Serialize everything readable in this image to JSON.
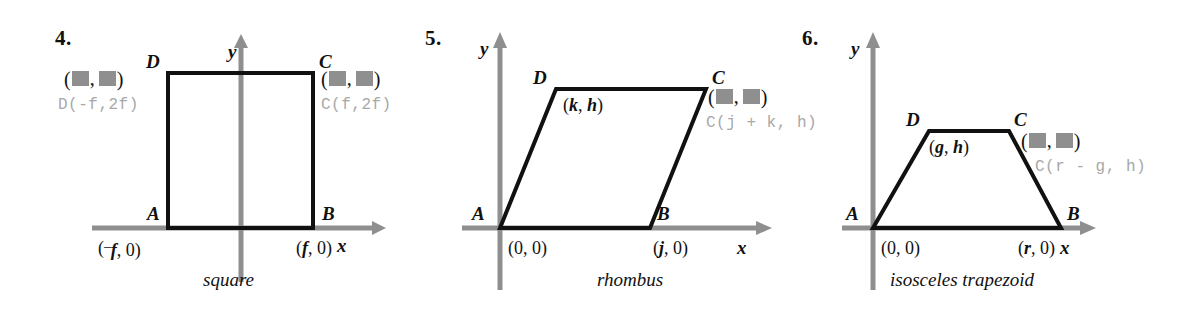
{
  "page": {
    "background": "#ffffff",
    "axis_color": "#8f8f8f",
    "shape_color": "#111111",
    "answer_color": "#a8a8a8",
    "redaction_color": "#8f8f8f"
  },
  "problems": [
    {
      "number": "4.",
      "caption": "square",
      "shape": "square",
      "y_axis_label": "y",
      "x_axis_label": "x",
      "vertices": {
        "A": "A",
        "B": "B",
        "C": "C",
        "D": "D"
      },
      "coords": {
        "A": "(⁻f, 0)",
        "B": "(f, 0)"
      },
      "redacted": {
        "D": "(█, █)",
        "C": "(█, █)"
      },
      "answers": {
        "D": "D(-f,2f)",
        "C": "C(f,2f)"
      }
    },
    {
      "number": "5.",
      "caption": "rhombus",
      "shape": "rhombus",
      "y_axis_label": "y",
      "x_axis_label": "x",
      "vertices": {
        "A": "A",
        "B": "B",
        "C": "C",
        "D": "D"
      },
      "coords": {
        "A": "(0, 0)",
        "B": "(j, 0)",
        "D": "(k, h)"
      },
      "redacted": {
        "C": "(█, █)"
      },
      "answers": {
        "C": "C(j + k, h)"
      }
    },
    {
      "number": "6.",
      "caption": "isosceles  trapezoid",
      "shape": "isosceles trapezoid",
      "y_axis_label": "y",
      "x_axis_label": "x",
      "vertices": {
        "A": "A",
        "B": "B",
        "C": "C",
        "D": "D"
      },
      "coords": {
        "A": "(0, 0)",
        "B": "(r, 0)",
        "D": "(g, h)"
      },
      "redacted": {
        "C": "(█, █)"
      },
      "answers": {
        "C": "C(r - g, h)"
      }
    }
  ]
}
